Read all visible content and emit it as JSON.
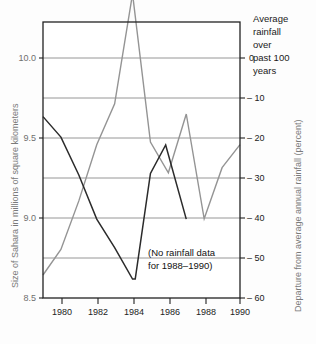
{
  "chart_data": {
    "type": "line",
    "title": "",
    "subtitle": "",
    "x": [
      1979,
      1980,
      1981,
      1982,
      1983,
      1984,
      1985,
      1986,
      1987,
      1988,
      1989,
      1990
    ],
    "xlabel": "",
    "xlim": [
      1979,
      1990
    ],
    "xticks": [
      1980,
      1982,
      1984,
      1986,
      1988,
      1990
    ],
    "xtick_labels": [
      "1980",
      "1982",
      "1984",
      "1986",
      "1988",
      "1990"
    ],
    "grid": true,
    "legend_position": "none",
    "left_axis": {
      "label": "Size of Sahara in millions of square kilometers",
      "ticks": [
        8.5,
        9.0,
        9.5,
        10.0
      ],
      "tick_labels": [
        "8.5",
        "9.0",
        "9.5",
        "10.0"
      ],
      "lim": [
        8.5,
        10.25
      ]
    },
    "right_axis": {
      "label": "Departure from average annual rainfall (percent)",
      "ticks": [
        0,
        -10,
        -20,
        -30,
        -40,
        -50,
        -60
      ],
      "tick_labels": [
        "0",
        "– 10",
        "– 20",
        "– 30",
        "– 40",
        "– 50",
        "– 60"
      ],
      "lim": [
        -60,
        -6
      ]
    },
    "series": [
      {
        "name": "Size of Sahara",
        "axis": "left",
        "color": "#2b2b2b",
        "x": [
          1979,
          1980,
          1981,
          1982,
          1983,
          1984,
          1984.15,
          1985,
          1985.85,
          1987
        ],
        "values": [
          9.65,
          9.52,
          9.28,
          9.0,
          8.82,
          8.62,
          8.62,
          9.29,
          9.47,
          9.0
        ]
      },
      {
        "name": "Average annual rainfall departure",
        "axis": "right",
        "color": "#949494",
        "x": [
          1979,
          1980,
          1981,
          1982,
          1983,
          1984,
          1985,
          1986,
          1987,
          1988,
          1989,
          1990
        ],
        "values": [
          -55.5,
          -50.5,
          -41.0,
          -30.0,
          -22.0,
          -0.5,
          -29.5,
          -35.5,
          -24.0,
          -44.5,
          -34.5,
          -30.0
        ]
      }
    ],
    "annotations": [
      {
        "name": "no-rainfall-data-note",
        "text_lines": [
          "(No rainfall data",
          "for 1988–1990)"
        ],
        "x": 1985.0,
        "y": -50
      },
      {
        "name": "average-rainfall-note",
        "text_lines": [
          "Average",
          "rainfall",
          "over",
          "past 100",
          "years"
        ]
      }
    ]
  },
  "axes": {
    "left_title": "Size of Sahara in millions of square kilometers",
    "right_title": "Departure from average annual rainfall (percent)",
    "left_tick_0": "8.5",
    "left_tick_1": "9.0",
    "left_tick_2": "9.5",
    "left_tick_3": "10.0",
    "right_tick_0": "0",
    "right_tick_1": "– 10",
    "right_tick_2": "– 20",
    "right_tick_3": "– 30",
    "right_tick_4": "– 40",
    "right_tick_5": "– 50",
    "right_tick_6": "– 60",
    "x_tick_0": "1980",
    "x_tick_1": "1982",
    "x_tick_2": "1984",
    "x_tick_3": "1986",
    "x_tick_4": "1988",
    "x_tick_5": "1990"
  },
  "notes": {
    "corner_line_1": "Average",
    "corner_line_2": "rainfall",
    "corner_line_3": "over",
    "corner_line_4": "past 100",
    "corner_line_5": "years",
    "annotation_line_1": "(No rainfall data",
    "annotation_line_2": "for 1988–1990)"
  },
  "colors": {
    "sahara_line": "#2b2b2b",
    "rainfall_line": "#949494",
    "grid": "#8a8a8a",
    "frame": "#222222",
    "left_label": "#7a7a7a",
    "background": "#fdfdfd"
  }
}
